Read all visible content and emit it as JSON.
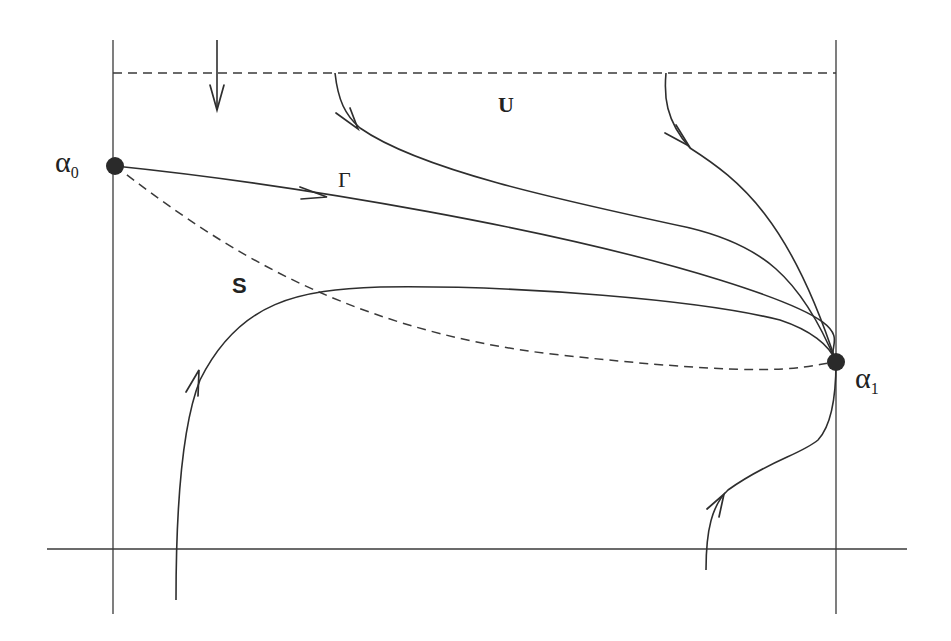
{
  "diagram": {
    "type": "phase-portrait",
    "labels": {
      "alpha0": "α",
      "alpha0_sub": "0",
      "alpha1": "α",
      "alpha1_sub": "1",
      "gamma": "Γ",
      "U": "U",
      "S": "S"
    },
    "points": [
      {
        "name": "alpha0",
        "x": 115,
        "y": 166
      },
      {
        "name": "alpha1",
        "x": 836,
        "y": 362
      }
    ],
    "colors": {
      "ink": "#2e2e2e",
      "background": "#ffffff"
    }
  }
}
